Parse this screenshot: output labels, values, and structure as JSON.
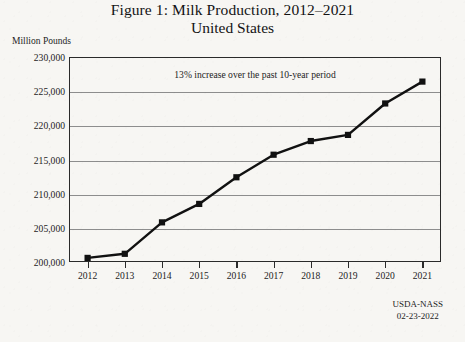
{
  "figure": {
    "title_line1": "Figure 1: Milk Production, 2012–2021",
    "title_line2": "United States",
    "y_axis_unit": "Million Pounds",
    "annotation": "13% increase over the past 10-year period",
    "source_line1": "USDA-NASS",
    "source_line2": "02-23-2022",
    "line_color": "#111111",
    "marker_color": "#111111",
    "grid_color": "#8d8d8d",
    "frame_color": "#2a2a2a",
    "background_color": "#f7f6f3"
  },
  "chart_data": {
    "type": "line",
    "title": "Figure 1: Milk Production, 2012–2021 United States",
    "subtitle": "United States",
    "xlabel": "",
    "ylabel": "Million Pounds",
    "categories": [
      2012,
      2013,
      2014,
      2015,
      2016,
      2017,
      2018,
      2019,
      2020,
      2021
    ],
    "x_tick_labels": [
      "2012",
      "2013",
      "2014",
      "2015",
      "2016",
      "2017",
      "2018",
      "2019",
      "2020",
      "2021"
    ],
    "values": [
      200600,
      201200,
      205800,
      208500,
      212400,
      215700,
      217700,
      218600,
      223200,
      226400
    ],
    "y_tick_labels": [
      "200,000",
      "205,000",
      "210,000",
      "215,000",
      "220,000",
      "225,000",
      "230,000"
    ],
    "y_ticks": [
      200000,
      205000,
      210000,
      215000,
      220000,
      225000,
      230000
    ],
    "ylim": [
      200000,
      230000
    ],
    "grid": true,
    "grid_axis": "y",
    "legend": false,
    "marker": "square",
    "annotations": [
      "13% increase over the past 10-year period"
    ],
    "source": "USDA-NASS 02-23-2022"
  }
}
